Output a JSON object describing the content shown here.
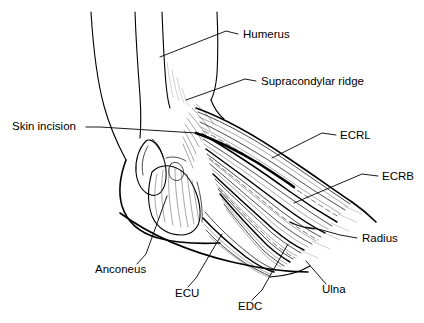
{
  "figure": {
    "width": 424,
    "height": 323,
    "background_color": "#ffffff",
    "ink_color": "#000000",
    "style": "black-and-white anatomical line drawing"
  },
  "labels": [
    {
      "id": "humerus",
      "text": "Humerus",
      "text_x": 243,
      "text_y": 38,
      "anchor": "start",
      "leader": "M 238,34 L 226,31 L 160,57"
    },
    {
      "id": "supracondylar-ridge",
      "text": "Supracondylar ridge",
      "text_x": 261,
      "text_y": 85,
      "anchor": "start",
      "leader": "M 256,81 L 245,79 L 186,100"
    },
    {
      "id": "skin-incision",
      "text": "Skin incision",
      "text_x": 12,
      "text_y": 130,
      "anchor": "start",
      "leader": "M 86,127 L 100,127 L 196,133"
    },
    {
      "id": "ecrl",
      "text": "ECRL",
      "text_x": 340,
      "text_y": 139,
      "anchor": "start",
      "leader": "M 336,135 L 322,133 L 272,158"
    },
    {
      "id": "ecrb",
      "text": "ECRB",
      "text_x": 382,
      "text_y": 180,
      "anchor": "start",
      "leader": "M 378,176 L 362,174 L 294,203"
    },
    {
      "id": "radius",
      "text": "Radius",
      "text_x": 362,
      "text_y": 242,
      "anchor": "start",
      "leader": "M 357,238 L 340,235 L 322,230 L 306,227"
    },
    {
      "id": "ulna",
      "text": "Ulna",
      "text_x": 322,
      "text_y": 293,
      "anchor": "start",
      "leader": "M 326,284 L 320,277 L 306,261"
    },
    {
      "id": "edc",
      "text": "EDC",
      "text_x": 238,
      "text_y": 310,
      "anchor": "start",
      "leader": "M 252,300 L 262,290 L 288,244"
    },
    {
      "id": "ecu",
      "text": "ECU",
      "text_x": 175,
      "text_y": 297,
      "anchor": "start",
      "leader": "M 188,287 L 196,278 L 222,234"
    },
    {
      "id": "anconeus",
      "text": "Anconeus",
      "text_x": 95,
      "text_y": 273,
      "anchor": "start",
      "leader": "M 137,264 L 146,254 L 167,196"
    }
  ],
  "structures": [
    {
      "id": "upper-arm-anterior-skin",
      "name": "anterior skin contour of upper arm"
    },
    {
      "id": "upper-arm-posterior-skin",
      "name": "posterior skin contour of upper arm"
    },
    {
      "id": "humerus-shaft-medial",
      "name": "humerus shaft medial border"
    },
    {
      "id": "humerus-shaft-lateral",
      "name": "humerus shaft lateral border"
    },
    {
      "id": "olecranon",
      "name": "olecranon process"
    },
    {
      "id": "supracondylar-ridge-line",
      "name": "lateral supracondylar ridge"
    },
    {
      "id": "anconeus-muscle",
      "name": "anconeus muscle belly"
    },
    {
      "id": "ecrl-muscle",
      "name": "extensor carpi radialis longus"
    },
    {
      "id": "ecrb-muscle",
      "name": "extensor carpi radialis brevis"
    },
    {
      "id": "edc-muscle",
      "name": "extensor digitorum communis"
    },
    {
      "id": "ecu-muscle",
      "name": "extensor carpi ulnaris"
    },
    {
      "id": "radius-bone",
      "name": "radius"
    },
    {
      "id": "ulna-bone",
      "name": "ulna"
    },
    {
      "id": "skin-incision-line",
      "name": "planned skin incision"
    },
    {
      "id": "forearm-volar-skin",
      "name": "volar forearm skin contour"
    },
    {
      "id": "forearm-dorsal-skin",
      "name": "dorsal forearm skin contour"
    }
  ]
}
